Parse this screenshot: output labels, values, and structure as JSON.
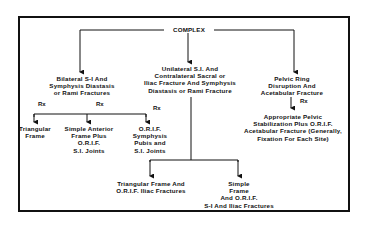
{
  "diagram": {
    "root": "COMPLEX",
    "rx_label": "Rx",
    "branches": [
      {
        "id": "bilateral",
        "title_lines": [
          "Bilateral S-I And",
          "Symphysis Diastasis",
          "or Rami Fractures"
        ],
        "treatments": [
          {
            "lines": [
              "Triangular",
              "Frame"
            ]
          },
          {
            "lines": [
              "Simple Anterior",
              "Frame Plus",
              "O.R.I.F.",
              "S.I. Joints"
            ]
          },
          {
            "lines": [
              "O.R.I.F.",
              "Symphysis",
              "Pubis and",
              "S.I. Joints"
            ]
          }
        ]
      },
      {
        "id": "unilateral",
        "title_lines": [
          "Unilateral S.I. And",
          "Contralateral Sacral or",
          "Iliac Fracture And Symphysis",
          "Diastasis or Rami Fracture"
        ],
        "treatments": [
          {
            "lines": [
              "Triangular Frame And",
              "O.R.I.F. Iliac Fractures"
            ]
          },
          {
            "lines": [
              "Simple",
              "Frame",
              "And O.R.I.F.",
              "S-I And Iliac Fractures"
            ]
          }
        ]
      },
      {
        "id": "acetabular",
        "title_lines": [
          "Pelvic Ring",
          "Disruption And",
          "Acetabular Fracture"
        ],
        "treatments": [
          {
            "lines": [
              "Appropriate Pelvic",
              "Stabilization Plus O.R.I.F.",
              "Acetabular Fracture (Generally,",
              "Fixation For Each Site)"
            ]
          }
        ]
      }
    ]
  }
}
